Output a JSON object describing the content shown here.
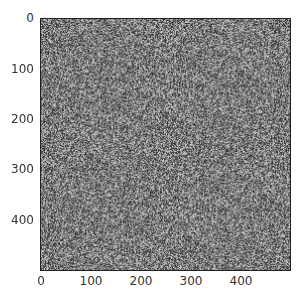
{
  "chart_data": {
    "type": "heatmap",
    "title": "",
    "xlabel": "",
    "ylabel": "",
    "colormap": "gray",
    "xlim": [
      0,
      500
    ],
    "ylim": [
      500,
      0
    ],
    "xticks": [
      0,
      100,
      200,
      300,
      400
    ],
    "yticks": [
      0,
      100,
      200,
      300,
      400
    ],
    "grid": false,
    "legend": null
  },
  "axes": {
    "xtick_labels": [
      "0",
      "100",
      "200",
      "300",
      "400"
    ],
    "ytick_labels": [
      "0",
      "100",
      "200",
      "300",
      "400"
    ]
  }
}
